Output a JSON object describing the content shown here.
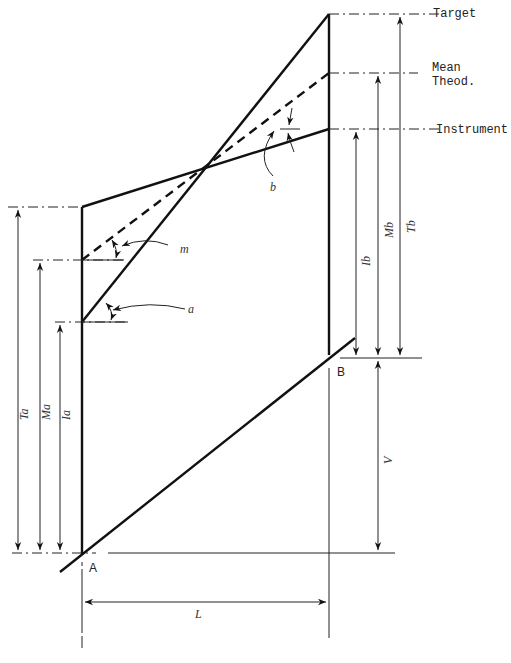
{
  "diagram": {
    "right_labels": {
      "target": "Target",
      "mean_theod_line1": "Mean",
      "mean_theod_line2": "Theod.",
      "instrument": "Instrument"
    },
    "angle_labels": {
      "a": "a",
      "m": "m",
      "b": "b"
    },
    "dimension_labels": {
      "Ta": "Ta",
      "Ma": "Ma",
      "Ia": "Ia",
      "Ib": "Ib",
      "Mb": "Mb",
      "Tb": "Tb",
      "V": "V",
      "L": "L"
    },
    "points": {
      "A": "A",
      "B": "B"
    },
    "colors": {
      "line": "#111111",
      "background": "#ffffff"
    }
  }
}
